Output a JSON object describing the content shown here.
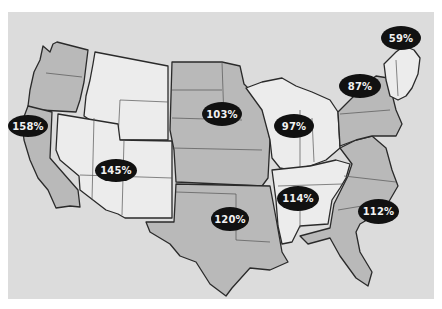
{
  "map": {
    "title": "",
    "colors": {
      "background": "#ffffff",
      "panel": "#dcdcdc",
      "region_gray": "#b9b9b9",
      "region_white": "#ececec",
      "label_bg": "#111111",
      "label_text": "#f2f2f2",
      "border": "#2a2a2a"
    },
    "regions": [
      {
        "name": "Pacific Northwest (WA, OR)",
        "shade": "gray",
        "label": ""
      },
      {
        "name": "California",
        "shade": "gray",
        "label": "158%"
      },
      {
        "name": "Mountain North (ID, MT, WY)",
        "shade": "white",
        "label": ""
      },
      {
        "name": "Southwest (NV, UT, CO, AZ, NM)",
        "shade": "white",
        "label": "145%"
      },
      {
        "name": "Plains (ND, SD, NE, KS, MN, IA, MO)",
        "shade": "gray",
        "label": "103%"
      },
      {
        "name": "South Central (OK, TX, AR, LA)",
        "shade": "gray",
        "label": "120%"
      },
      {
        "name": "Great Lakes (WI, MI, IL, IN, OH)",
        "shade": "white",
        "label": "97%"
      },
      {
        "name": "East South Central (KY, TN, MS, AL)",
        "shade": "white",
        "label": "114%"
      },
      {
        "name": "South Atlantic (WV, VA, NC, SC, GA, FL)",
        "shade": "gray",
        "label": "112%"
      },
      {
        "name": "Middle Atlantic (NY, PA, NJ)",
        "shade": "gray",
        "label": "87%"
      },
      {
        "name": "New England",
        "shade": "white",
        "label": "59%"
      }
    ],
    "labels": [
      {
        "text": "158%",
        "x": 8,
        "y": 115,
        "w": 40,
        "h": 22
      },
      {
        "text": "145%",
        "x": 95,
        "y": 159,
        "w": 42,
        "h": 23
      },
      {
        "text": "103%",
        "x": 202,
        "y": 102,
        "w": 40,
        "h": 24
      },
      {
        "text": "97%",
        "x": 274,
        "y": 114,
        "w": 40,
        "h": 24
      },
      {
        "text": "120%",
        "x": 211,
        "y": 207,
        "w": 38,
        "h": 24
      },
      {
        "text": "114%",
        "x": 277,
        "y": 186,
        "w": 42,
        "h": 25
      },
      {
        "text": "112%",
        "x": 358,
        "y": 199,
        "w": 41,
        "h": 25
      },
      {
        "text": "87%",
        "x": 339,
        "y": 74,
        "w": 42,
        "h": 24
      },
      {
        "text": "59%",
        "x": 381,
        "y": 26,
        "w": 40,
        "h": 24
      }
    ]
  }
}
